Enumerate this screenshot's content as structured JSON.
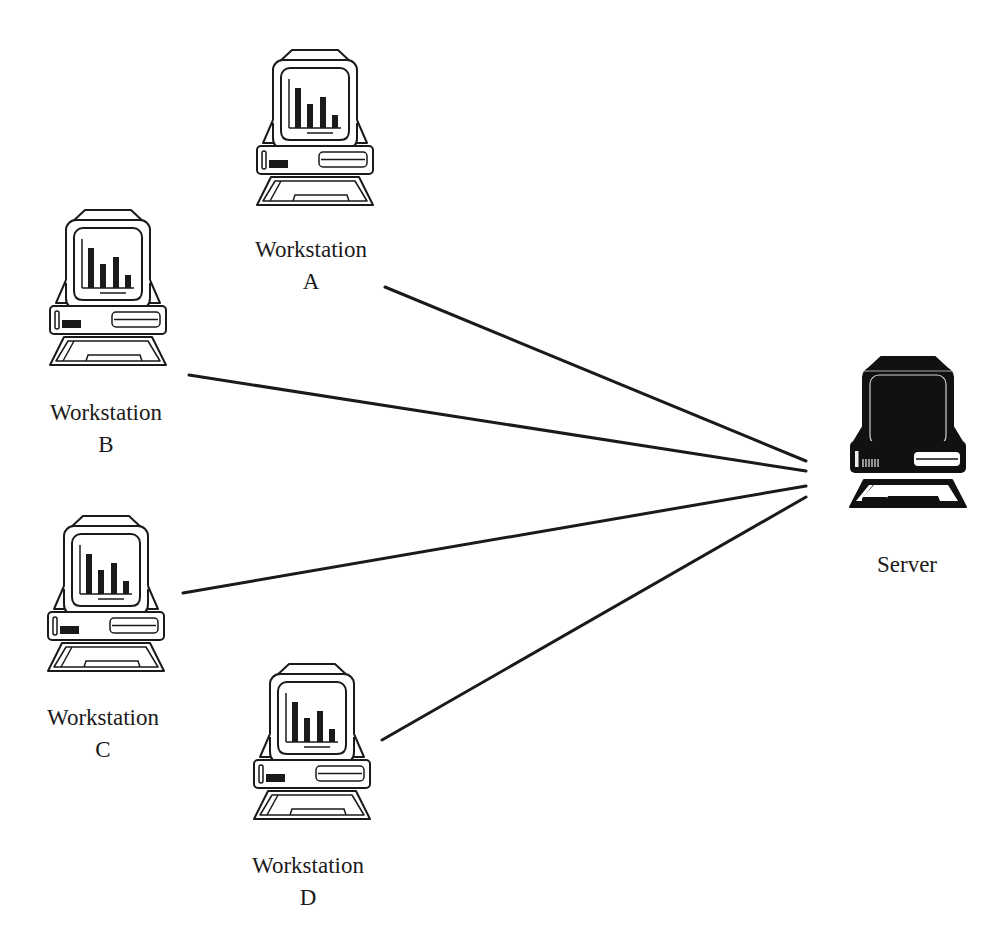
{
  "diagram": {
    "type": "network-star-topology",
    "colors": {
      "background": "#ffffff",
      "line": "#1a1a1a",
      "icon_outline": "#1a1a1a",
      "server_fill": "#111111"
    },
    "nodes": [
      {
        "id": "workstation-a",
        "kind": "workstation",
        "label_line1": "Workstation",
        "label_line2": "A",
        "icon": "workstation-computer-icon"
      },
      {
        "id": "workstation-b",
        "kind": "workstation",
        "label_line1": "Workstation",
        "label_line2": "B",
        "icon": "workstation-computer-icon"
      },
      {
        "id": "workstation-c",
        "kind": "workstation",
        "label_line1": "Workstation",
        "label_line2": "C",
        "icon": "workstation-computer-icon"
      },
      {
        "id": "workstation-d",
        "kind": "workstation",
        "label_line1": "Workstation",
        "label_line2": "D",
        "icon": "workstation-computer-icon"
      },
      {
        "id": "server",
        "kind": "server",
        "label_line1": "Server",
        "icon": "server-computer-icon"
      }
    ],
    "edges": [
      {
        "from": "workstation-a",
        "to": "server"
      },
      {
        "from": "workstation-b",
        "to": "server"
      },
      {
        "from": "workstation-c",
        "to": "server"
      },
      {
        "from": "workstation-d",
        "to": "server"
      }
    ]
  }
}
